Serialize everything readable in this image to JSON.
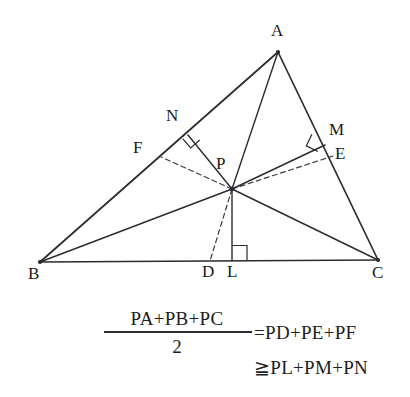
{
  "figure": {
    "stroke_color": "#2b2b30",
    "background": "#ffffff",
    "points": [
      {
        "name": "A",
        "label": "A",
        "x": 278,
        "y": 52,
        "label_x": 271,
        "label_y": 22
      },
      {
        "name": "B",
        "label": "B",
        "x": 40,
        "y": 262,
        "label_x": 28,
        "label_y": 265
      },
      {
        "name": "C",
        "label": "C",
        "x": 378,
        "y": 260,
        "label_x": 372,
        "label_y": 264
      },
      {
        "name": "P",
        "label": "P",
        "x": 232,
        "y": 189,
        "label_x": 216,
        "label_y": 155
      },
      {
        "name": "N",
        "label": "N",
        "x": 188,
        "y": 135,
        "label_x": 166,
        "label_y": 107
      },
      {
        "name": "F",
        "label": "F",
        "x": 161,
        "y": 157,
        "label_x": 133,
        "label_y": 139
      },
      {
        "name": "M",
        "label": "M",
        "x": 325,
        "y": 145,
        "label_x": 329,
        "label_y": 121
      },
      {
        "name": "E",
        "label": "E",
        "x": 333,
        "y": 156,
        "label_x": 335,
        "label_y": 145
      },
      {
        "name": "D",
        "label": "D",
        "x": 210,
        "y": 261,
        "label_x": 202,
        "label_y": 263
      },
      {
        "name": "L",
        "label": "L",
        "x": 232,
        "y": 261,
        "label_x": 227,
        "label_y": 263
      }
    ],
    "solid_segments": [
      {
        "name": "side-AB",
        "from": "A",
        "to": "B"
      },
      {
        "name": "side-BC",
        "from": "B",
        "to": "C"
      },
      {
        "name": "side-CA",
        "from": "C",
        "to": "A"
      },
      {
        "name": "cevian-AP",
        "from": "A",
        "to": "P"
      },
      {
        "name": "cevian-BP",
        "from": "B",
        "to": "P"
      },
      {
        "name": "cevian-CP",
        "from": "C",
        "to": "P"
      },
      {
        "name": "perpendicular-PN",
        "from": "P",
        "to": "N"
      },
      {
        "name": "perpendicular-PL",
        "from": "P",
        "to": "L"
      },
      {
        "name": "perpendicular-PM",
        "from": "P",
        "to": "M"
      }
    ],
    "dashed_segments": [
      {
        "name": "segment-PF",
        "from": "P",
        "to": "F"
      },
      {
        "name": "segment-PE",
        "from": "P",
        "to": "E"
      },
      {
        "name": "segment-PD",
        "from": "P",
        "to": "D"
      }
    ],
    "right_angle_marks": [
      {
        "name": "right-angle-at-N",
        "vertex": "N"
      },
      {
        "name": "right-angle-at-M",
        "vertex": "M"
      },
      {
        "name": "right-angle-at-L",
        "vertex": "L"
      }
    ]
  },
  "formula": {
    "numerator": "PA+PB+PC",
    "denominator": "2",
    "equals_expression": "=PD+PE+PF",
    "inequality_expression": "≧PL+PM+PN",
    "equals_sign": "=",
    "inequality_sign": "≧"
  }
}
